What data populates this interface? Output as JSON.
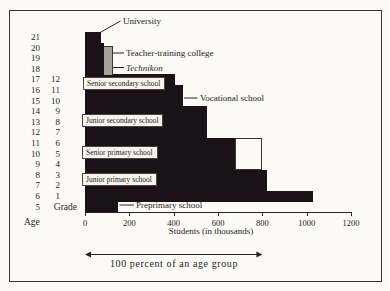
{
  "chart_data": {
    "type": "bar",
    "orientation": "horizontal",
    "title": "",
    "xlabel": "Students (in thousands)",
    "x_ticks": [
      0,
      200,
      400,
      600,
      800,
      1000,
      1200
    ],
    "xlim": [
      0,
      1200
    ],
    "age_axis_title": "Age",
    "rows": [
      {
        "age": "21",
        "grade": "",
        "value": 70
      },
      {
        "age": "20",
        "grade": "",
        "value": 85
      },
      {
        "age": "19",
        "grade": "",
        "value": 85
      },
      {
        "age": "18",
        "grade": "",
        "value": 85
      },
      {
        "age": "17",
        "grade": "12",
        "value": 405
      },
      {
        "age": "16",
        "grade": "11",
        "value": 440
      },
      {
        "age": "15",
        "grade": "10",
        "value": 440
      },
      {
        "age": "14",
        "grade": "9",
        "value": 550
      },
      {
        "age": "13",
        "grade": "8",
        "value": 550
      },
      {
        "age": "12",
        "grade": "7",
        "value": 550
      },
      {
        "age": "11",
        "grade": "6",
        "value": 675
      },
      {
        "age": "10",
        "grade": "5",
        "value": 675
      },
      {
        "age": "9",
        "grade": "4",
        "value": 675
      },
      {
        "age": "8",
        "grade": "3",
        "value": 820
      },
      {
        "age": "7",
        "grade": "2",
        "value": 820
      },
      {
        "age": "6",
        "grade": "1",
        "value": 1030
      },
      {
        "age": "5",
        "grade": "Grade",
        "value": 150
      }
    ],
    "overlays": [
      {
        "id": "technikon-bar",
        "from_value": 85,
        "to_value": 120,
        "first_age": "20",
        "last_age": "18",
        "style": "gray"
      },
      {
        "id": "open-box",
        "from_value": 675,
        "to_value": 800,
        "first_age": "11",
        "last_age": "9",
        "style": "outline"
      }
    ],
    "school_labels": [
      {
        "id": "senior-secondary",
        "text": "Senior secondary school"
      },
      {
        "id": "junior-secondary",
        "text": "Junior secondary school"
      },
      {
        "id": "senior-primary",
        "text": "Senior primary school"
      },
      {
        "id": "junior-primary",
        "text": "Junior primary school"
      }
    ],
    "pointer_labels": [
      {
        "id": "university",
        "text": "University",
        "italic": false
      },
      {
        "id": "teacher-training",
        "text": "Teacher-training college",
        "italic": false
      },
      {
        "id": "technikon",
        "text": "Technikon",
        "italic": true
      },
      {
        "id": "vocational",
        "text": "Vocational school",
        "italic": false
      },
      {
        "id": "preprimary",
        "text": "Preprimary school",
        "italic": false
      }
    ]
  },
  "footer": {
    "text": "100 percent of an age group",
    "arrow_from_value": 0,
    "arrow_to_value": 800
  },
  "colors": {
    "bar": "#1a1216",
    "technikon_gray": "#a5a09a",
    "label_box_bg": "#f6f3ec",
    "background": "#fbfaf6",
    "ink": "#2a2522"
  }
}
